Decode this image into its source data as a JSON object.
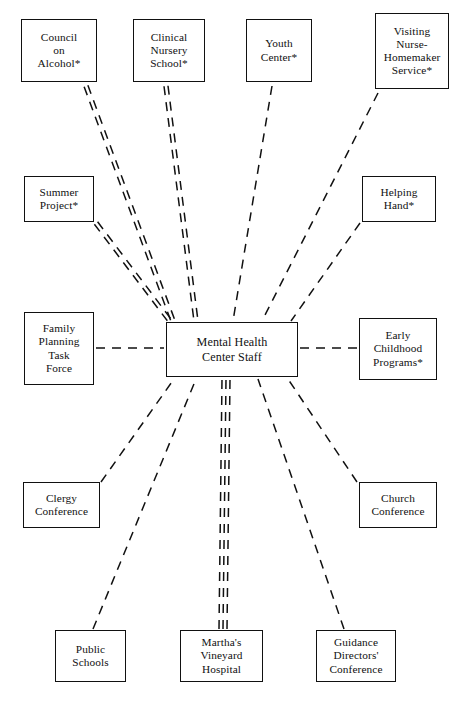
{
  "diagram": {
    "type": "hub-and-spoke network diagram",
    "center": {
      "id": "center",
      "label": "Mental Health\nCenter Staff",
      "x": 166,
      "y": 322,
      "w": 132,
      "h": 55
    },
    "nodes": [
      {
        "id": "council-on-alcohol",
        "label": "Council\non\nAlcohol*",
        "x": 21,
        "y": 19,
        "w": 76,
        "h": 63,
        "starred": true
      },
      {
        "id": "clinical-nursery-school",
        "label": "Clinical\nNursery\nSchool*",
        "x": 133,
        "y": 19,
        "w": 72,
        "h": 63,
        "starred": true
      },
      {
        "id": "youth-center",
        "label": "Youth\nCenter*",
        "x": 246,
        "y": 19,
        "w": 66,
        "h": 63,
        "starred": true
      },
      {
        "id": "visiting-nurse-homemaker-service",
        "label": "Visiting\nNurse-\nHomemaker\nService*",
        "x": 375,
        "y": 13,
        "w": 74,
        "h": 76,
        "starred": true
      },
      {
        "id": "summer-project",
        "label": "Summer\nProject*",
        "x": 24,
        "y": 176,
        "w": 70,
        "h": 46,
        "starred": true
      },
      {
        "id": "helping-hand",
        "label": "Helping\nHand*",
        "x": 362,
        "y": 176,
        "w": 74,
        "h": 46,
        "starred": true
      },
      {
        "id": "family-planning-task-force",
        "label": "Family\nPlanning\nTask\nForce",
        "x": 24,
        "y": 312,
        "w": 70,
        "h": 73,
        "starred": false
      },
      {
        "id": "early-childhood-programs",
        "label": "Early\nChildhood\nPrograms*",
        "x": 359,
        "y": 318,
        "w": 78,
        "h": 62,
        "starred": true
      },
      {
        "id": "clergy-conference",
        "label": "Clergy\nConference",
        "x": 23,
        "y": 482,
        "w": 77,
        "h": 46,
        "starred": false
      },
      {
        "id": "church-conference",
        "label": "Church\nConference",
        "x": 359,
        "y": 482,
        "w": 78,
        "h": 46,
        "starred": false
      },
      {
        "id": "public-schools",
        "label": "Public\nSchools",
        "x": 55,
        "y": 630,
        "w": 71,
        "h": 52,
        "starred": false
      },
      {
        "id": "marthas-vineyard-hospital",
        "label": "Martha's\nVineyard\nHospital",
        "x": 180,
        "y": 630,
        "w": 83,
        "h": 52,
        "starred": false
      },
      {
        "id": "guidance-directors-conference",
        "label": "Guidance\nDirectors'\nConference",
        "x": 316,
        "y": 630,
        "w": 80,
        "h": 52,
        "starred": false
      }
    ],
    "edges": [
      {
        "id": "edge-council-on-alcohol",
        "from": "council-on-alcohol",
        "to": "center",
        "multiplicity": 2,
        "x1": 86,
        "y1": 86,
        "x2": 173,
        "y2": 321
      },
      {
        "id": "edge-clinical-nursery-school",
        "from": "clinical-nursery-school",
        "to": "center",
        "multiplicity": 2,
        "x1": 166,
        "y1": 86,
        "x2": 196,
        "y2": 321
      },
      {
        "id": "edge-youth-center",
        "from": "youth-center",
        "to": "center",
        "multiplicity": 1,
        "x1": 272,
        "y1": 86,
        "x2": 233,
        "y2": 321
      },
      {
        "id": "edge-visiting-nurse-homemaker-service",
        "from": "visiting-nurse-homemaker-service",
        "to": "center",
        "multiplicity": 1,
        "x1": 378,
        "y1": 93,
        "x2": 262,
        "y2": 321
      },
      {
        "id": "edge-summer-project",
        "from": "summer-project",
        "to": "center",
        "multiplicity": 2,
        "x1": 96,
        "y1": 223,
        "x2": 170,
        "y2": 321
      },
      {
        "id": "edge-helping-hand",
        "from": "helping-hand",
        "to": "center",
        "multiplicity": 1,
        "x1": 360,
        "y1": 223,
        "x2": 291,
        "y2": 321
      },
      {
        "id": "edge-family-planning-task-force",
        "from": "family-planning-task-force",
        "to": "center",
        "multiplicity": 1,
        "x1": 96,
        "y1": 348,
        "x2": 164,
        "y2": 348
      },
      {
        "id": "edge-early-childhood-programs",
        "from": "early-childhood-programs",
        "to": "center",
        "multiplicity": 1,
        "x1": 357,
        "y1": 348,
        "x2": 300,
        "y2": 348
      },
      {
        "id": "edge-clergy-conference",
        "from": "clergy-conference",
        "to": "center",
        "multiplicity": 1,
        "x1": 101,
        "y1": 482,
        "x2": 174,
        "y2": 379
      },
      {
        "id": "edge-church-conference",
        "from": "church-conference",
        "to": "center",
        "multiplicity": 1,
        "x1": 357,
        "y1": 482,
        "x2": 288,
        "y2": 379
      },
      {
        "id": "edge-public-schools",
        "from": "public-schools",
        "to": "center",
        "multiplicity": 1,
        "x1": 93,
        "y1": 629,
        "x2": 196,
        "y2": 379
      },
      {
        "id": "edge-marthas-vineyard-hospital",
        "from": "marthas-vineyard-hospital",
        "to": "center",
        "multiplicity": 3,
        "x1": 223,
        "y1": 629,
        "x2": 226,
        "y2": 379
      },
      {
        "id": "edge-guidance-directors-conference",
        "from": "guidance-directors-conference",
        "to": "center",
        "multiplicity": 1,
        "x1": 344,
        "y1": 629,
        "x2": 258,
        "y2": 379
      }
    ],
    "style": {
      "stroke": "#111111",
      "background": "#ffffff",
      "edge_dash": "9 7",
      "edge_width": 1.5,
      "multiplicity_gap": 4
    }
  }
}
